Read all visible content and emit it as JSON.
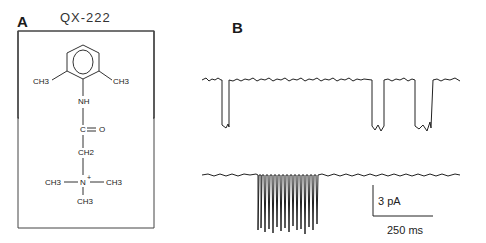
{
  "panel_a": {
    "label": "A",
    "compound_name": "QX-222",
    "structure": {
      "ring_substituent_left": "CH3",
      "ring_substituent_right": "CH3",
      "amide_nh": "NH",
      "carbonyl": "C = O",
      "methylene": "CH2",
      "nitrogen": "N",
      "nitrogen_charge": "+",
      "n_methyl_left": "CH3",
      "n_methyl_right": "CH3",
      "n_methyl_bottom": "CH3"
    }
  },
  "panel_b": {
    "label": "B",
    "description": "Single-channel current recordings",
    "scale_bar": {
      "current": "3 pA",
      "time": "250 ms"
    },
    "traces": [
      {
        "name": "trace-top",
        "events": "three discrete openings (downward deflections)"
      },
      {
        "name": "trace-bottom",
        "events": "burst of rapid flickering openings"
      }
    ]
  }
}
